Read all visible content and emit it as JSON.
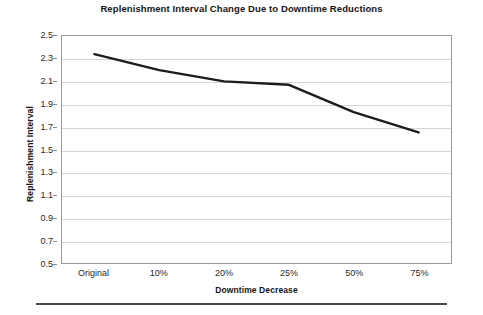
{
  "chart_data": {
    "type": "line",
    "title": "Replenishment Interval Change Due to Downtime Reductions",
    "xlabel": "Downtime Decrease",
    "ylabel": "Replenishment Interval",
    "categories": [
      "Original",
      "10%",
      "20%",
      "25%",
      "50%",
      "75%"
    ],
    "values": [
      2.34,
      2.2,
      2.1,
      2.07,
      1.83,
      1.65
    ],
    "series": [
      {
        "name": "Replenishment Interval",
        "values": [
          2.34,
          2.2,
          2.1,
          2.07,
          1.83,
          1.65
        ]
      }
    ],
    "ylim": [
      0.5,
      2.5
    ],
    "ytick_step": 0.2,
    "ytick_labels": [
      "2.5",
      "2.3",
      "2.1",
      "1.9",
      "1.7",
      "1.5",
      "1.3",
      "1.1",
      "0.9",
      "0.7",
      "0.5"
    ],
    "ytick_values": [
      2.5,
      2.3,
      2.1,
      1.9,
      1.7,
      1.5,
      1.3,
      1.1,
      0.9,
      0.7,
      0.5
    ],
    "grid": true,
    "grid_axis": "y",
    "legend": false,
    "legend_position": "none",
    "line_color": "#1c1c1c",
    "line_width": 2.4,
    "markers": false,
    "plot_border_color": "#9a9a9a",
    "gridline_color": "#d6d6d6",
    "background_color": "#ffffff"
  }
}
